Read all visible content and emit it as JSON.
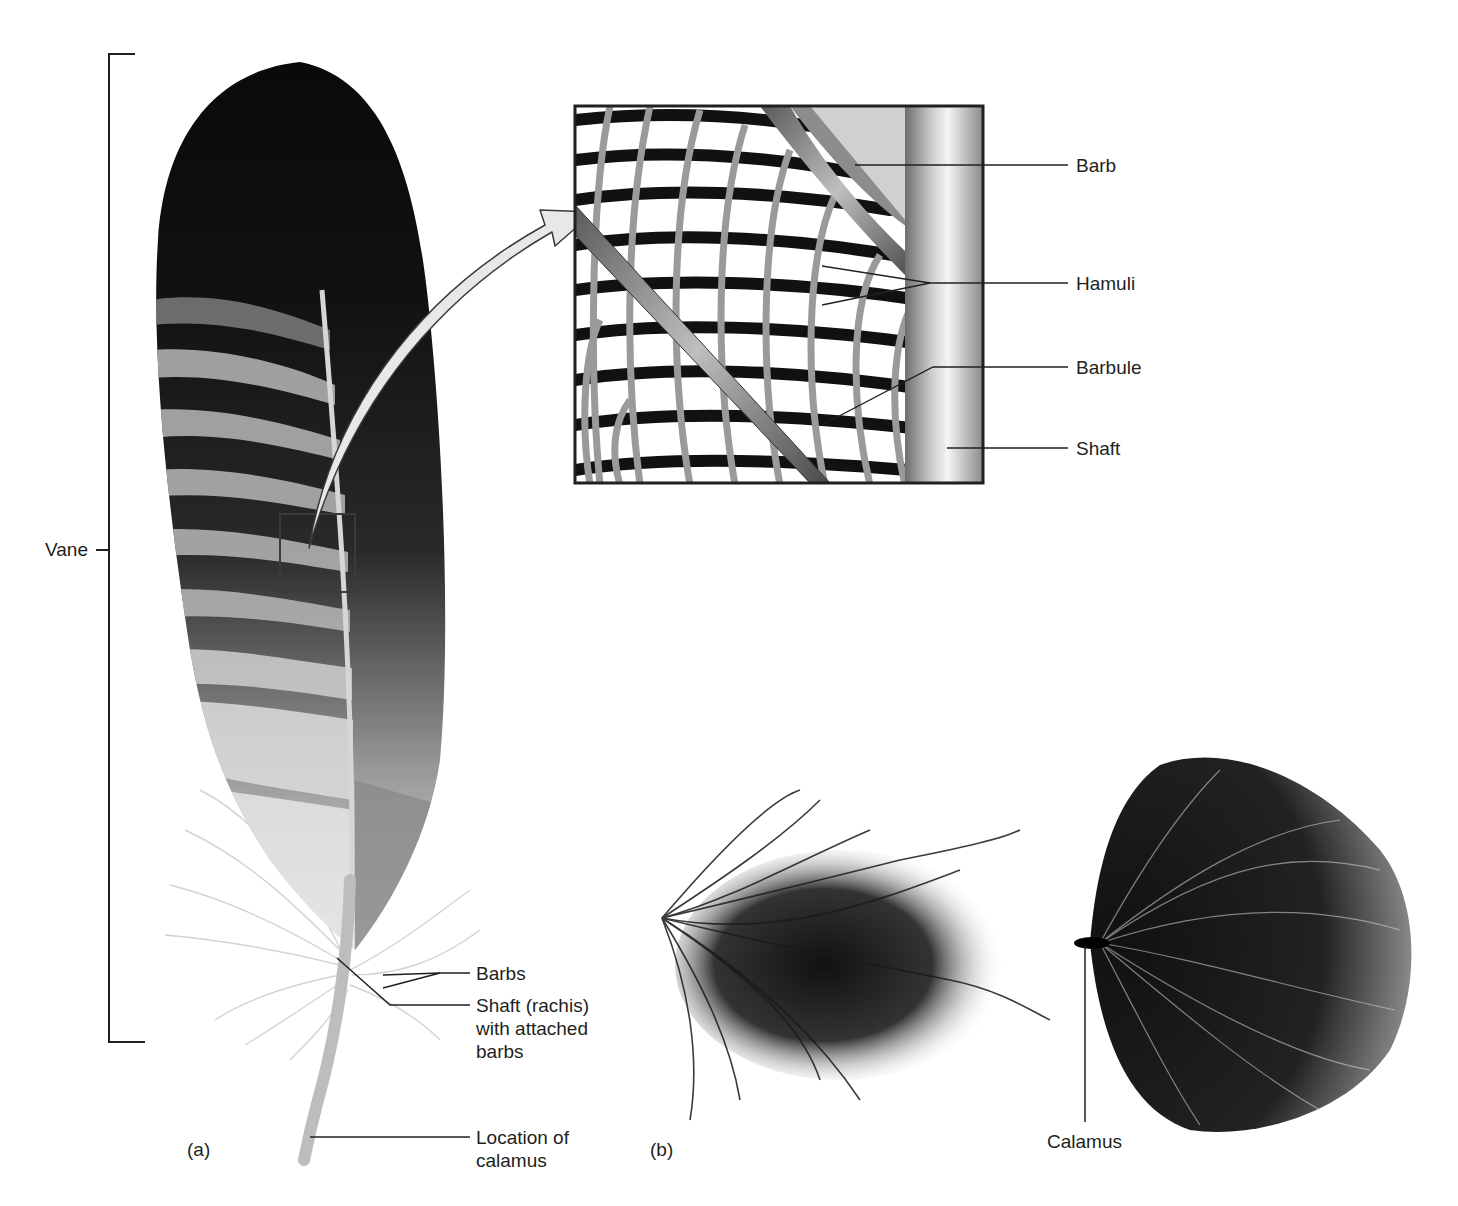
{
  "panels": {
    "a": {
      "label": "(a)"
    },
    "b": {
      "label": "(b)"
    }
  },
  "colors": {
    "ink": "#231f20",
    "feather_dark": "#0d0d0d",
    "feather_light": "#d9d9d9",
    "shaft": "#bdbdbd",
    "arrow_fill": "#e6e6e6"
  },
  "feather_a": {
    "vane_label": "Vane",
    "callouts": {
      "barbs": "Barbs",
      "shaft_rachis": "Shaft (rachis)\nwith attached\nbarbs",
      "calamus_location": "Location of\ncalamus"
    }
  },
  "inset": {
    "callouts": {
      "barb": "Barb",
      "hamuli": "Hamuli",
      "barbule": "Barbule",
      "shaft": "Shaft"
    }
  },
  "feather_b": {
    "callouts": {
      "calamus": "Calamus"
    }
  }
}
